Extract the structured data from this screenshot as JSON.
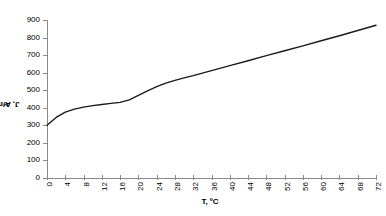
{
  "chart_data": {
    "type": "line",
    "title": "",
    "subtitle": "",
    "xlabel": "T, ºC",
    "ylabel": "J, A/m²",
    "xlim": [
      0,
      72
    ],
    "ylim": [
      0,
      900
    ],
    "grid": false,
    "legend": null,
    "x_ticks": [
      0,
      4,
      8,
      12,
      16,
      20,
      24,
      28,
      32,
      36,
      40,
      44,
      48,
      52,
      56,
      60,
      64,
      68,
      72
    ],
    "y_ticks": [
      0,
      100,
      200,
      300,
      400,
      500,
      600,
      700,
      800,
      900
    ],
    "line_color": "#1a1a1a",
    "axis_color": "#8a8a8a",
    "series": [
      {
        "name": "J vs T",
        "x": [
          0,
          2,
          4,
          6,
          8,
          10,
          12,
          14,
          16,
          18,
          20,
          22,
          24,
          26,
          28,
          30,
          32,
          36,
          40,
          44,
          48,
          52,
          56,
          60,
          64,
          68,
          72
        ],
        "values": [
          300,
          345,
          375,
          392,
          404,
          412,
          419,
          425,
          431,
          445,
          470,
          496,
          520,
          540,
          556,
          570,
          583,
          612,
          640,
          668,
          697,
          725,
          753,
          782,
          810,
          840,
          870
        ]
      }
    ]
  },
  "axis_titles": {
    "x": "T, ºC",
    "y_prefix": "J, A/m",
    "y_sup": "2"
  }
}
